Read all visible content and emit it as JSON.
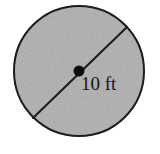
{
  "figure": {
    "name": "circle-with-diameter",
    "type": "geometry-diagram",
    "background_color": "#ffffff",
    "shape": {
      "kind": "circle",
      "fill_color": "#b9b9b9",
      "fill_texture": "grainy-noise",
      "outline_color": "#1a1a1a",
      "outline_width_px": 2,
      "center_x": 79,
      "center_y": 71,
      "radius_px": 66
    },
    "diameter_segment": {
      "name": "diameter-line",
      "color": "#1a1a1a",
      "width_px": 2,
      "x1": 33,
      "y1": 118,
      "x2": 127,
      "y2": 27,
      "angle_degrees": -44
    },
    "center_point": {
      "name": "center-dot",
      "color": "#111111",
      "x": 79,
      "y": 71,
      "radius_px": 5.5
    },
    "label": {
      "text": "10 ft",
      "value": "10",
      "unit": "ft",
      "measurement_of": "diameter",
      "color": "#141414",
      "font_size_px": 19,
      "x": 81,
      "y": 74
    }
  }
}
